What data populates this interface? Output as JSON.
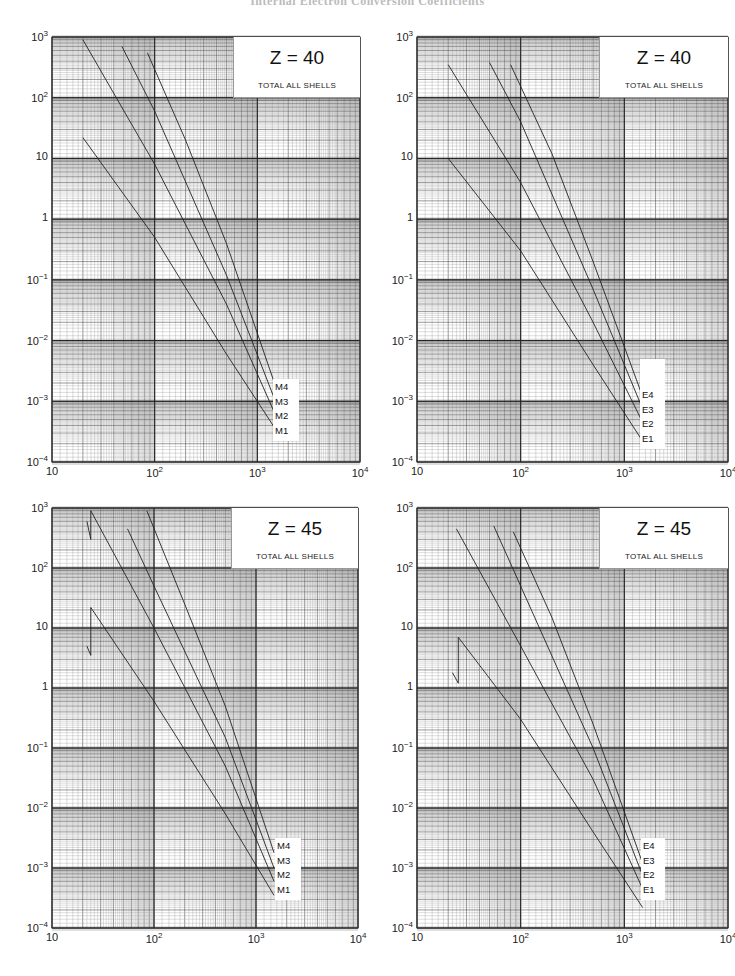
{
  "page": {
    "header": "Internal Electron Conversion Coefficients"
  },
  "axes": {
    "y_ticks": [
      {
        "base": "10",
        "exp": "3"
      },
      {
        "base": "10",
        "exp": "2"
      },
      {
        "base": "10",
        "exp": ""
      },
      {
        "base": "1",
        "exp": ""
      },
      {
        "base": "10",
        "exp": "−1"
      },
      {
        "base": "10",
        "exp": "−2"
      },
      {
        "base": "10",
        "exp": "−3"
      },
      {
        "base": "10",
        "exp": "−4"
      }
    ],
    "x_ticks": [
      {
        "base": "10",
        "exp": ""
      },
      {
        "base": "10",
        "exp": "2"
      },
      {
        "base": "10",
        "exp": "3"
      },
      {
        "base": "10",
        "exp": "4"
      }
    ]
  },
  "panels": [
    {
      "id": "tl",
      "z_label": "Z = 40",
      "subtitle": "TOTAL ALL SHELLS",
      "curve_labels": [
        "M4",
        "M3",
        "M2",
        "M1"
      ]
    },
    {
      "id": "tr",
      "z_label": "Z = 40",
      "subtitle": "TOTAL ALL SHELLS",
      "curve_labels": [
        "E4",
        "E3",
        "E2",
        "E1"
      ]
    },
    {
      "id": "bl",
      "z_label": "Z = 45",
      "subtitle": "TOTAL ALL SHELLS",
      "curve_labels": [
        "M4",
        "M3",
        "M2",
        "M1"
      ]
    },
    {
      "id": "br",
      "z_label": "Z = 45",
      "subtitle": "TOTAL ALL SHELLS",
      "curve_labels": [
        "E4",
        "E3",
        "E2",
        "E1"
      ]
    }
  ],
  "colors": {
    "grid_minor": "#8a8a8a",
    "grid_major": "#3a3a3a",
    "curve": "#222222",
    "background": "#ffffff"
  },
  "chart_data": [
    {
      "type": "line",
      "title": "Z = 40",
      "subtitle": "TOTAL ALL SHELLS",
      "xscale": "log",
      "yscale": "log",
      "xlim": [
        10,
        10000
      ],
      "ylim": [
        0.0001,
        1000
      ],
      "xlabel": "",
      "ylabel": "",
      "grid": true,
      "series": [
        {
          "name": "M1",
          "x": [
            20,
            100,
            500,
            1500
          ],
          "y": [
            22,
            0.5,
            0.006,
            0.00035
          ]
        },
        {
          "name": "M2",
          "x": [
            20,
            100,
            500,
            1500
          ],
          "y": [
            900,
            8,
            0.04,
            0.0006
          ]
        },
        {
          "name": "M3",
          "x": [
            48,
            100,
            500,
            1500
          ],
          "y": [
            700,
            60,
            0.12,
            0.001
          ]
        },
        {
          "name": "M4",
          "x": [
            85,
            200,
            500,
            1500
          ],
          "y": [
            550,
            20,
            0.4,
            0.0018
          ]
        }
      ]
    },
    {
      "type": "line",
      "title": "Z = 40",
      "subtitle": "TOTAL ALL SHELLS",
      "xscale": "log",
      "yscale": "log",
      "xlim": [
        10,
        10000
      ],
      "ylim": [
        0.0001,
        1000
      ],
      "xlabel": "",
      "ylabel": "",
      "grid": true,
      "series": [
        {
          "name": "E1",
          "x": [
            20,
            100,
            500,
            1500
          ],
          "y": [
            10,
            0.3,
            0.004,
            0.00022
          ]
        },
        {
          "name": "E2",
          "x": [
            20,
            100,
            500,
            1500
          ],
          "y": [
            350,
            4,
            0.02,
            0.00045
          ]
        },
        {
          "name": "E3",
          "x": [
            50,
            100,
            500,
            1500
          ],
          "y": [
            380,
            40,
            0.07,
            0.00075
          ]
        },
        {
          "name": "E4",
          "x": [
            80,
            200,
            500,
            1500
          ],
          "y": [
            350,
            12,
            0.2,
            0.0012
          ]
        }
      ]
    },
    {
      "type": "line",
      "title": "Z = 45",
      "subtitle": "TOTAL ALL SHELLS",
      "xscale": "log",
      "yscale": "log",
      "xlim": [
        10,
        10000
      ],
      "ylim": [
        0.0001,
        1000
      ],
      "xlabel": "",
      "ylabel": "",
      "grid": true,
      "series": [
        {
          "name": "M1",
          "x": [
            22,
            24,
            24,
            100,
            500,
            1500
          ],
          "y": [
            5,
            3.5,
            22,
            0.6,
            0.008,
            0.00035
          ]
        },
        {
          "name": "M2",
          "x": [
            22,
            24,
            24,
            100,
            500,
            1500
          ],
          "y": [
            600,
            300,
            900,
            10,
            0.05,
            0.0006
          ]
        },
        {
          "name": "M3",
          "x": [
            55,
            100,
            500,
            1500
          ],
          "y": [
            450,
            50,
            0.15,
            0.001
          ]
        },
        {
          "name": "M4",
          "x": [
            85,
            200,
            500,
            1500
          ],
          "y": [
            900,
            25,
            0.5,
            0.0018
          ]
        }
      ]
    },
    {
      "type": "line",
      "title": "Z = 45",
      "subtitle": "TOTAL ALL SHELLS",
      "xscale": "log",
      "yscale": "log",
      "xlim": [
        10,
        10000
      ],
      "ylim": [
        0.0001,
        1000
      ],
      "xlabel": "",
      "ylabel": "",
      "grid": true,
      "series": [
        {
          "name": "E1",
          "x": [
            22,
            25,
            25,
            100,
            500,
            1500
          ],
          "y": [
            1.8,
            1.2,
            7,
            0.3,
            0.004,
            0.00022
          ]
        },
        {
          "name": "E2",
          "x": [
            24,
            100,
            500,
            1500
          ],
          "y": [
            450,
            5,
            0.03,
            0.00045
          ]
        },
        {
          "name": "E3",
          "x": [
            55,
            100,
            500,
            1500
          ],
          "y": [
            500,
            50,
            0.1,
            0.00075
          ]
        },
        {
          "name": "E4",
          "x": [
            85,
            200,
            500,
            1500
          ],
          "y": [
            400,
            15,
            0.25,
            0.0012
          ]
        }
      ]
    }
  ]
}
